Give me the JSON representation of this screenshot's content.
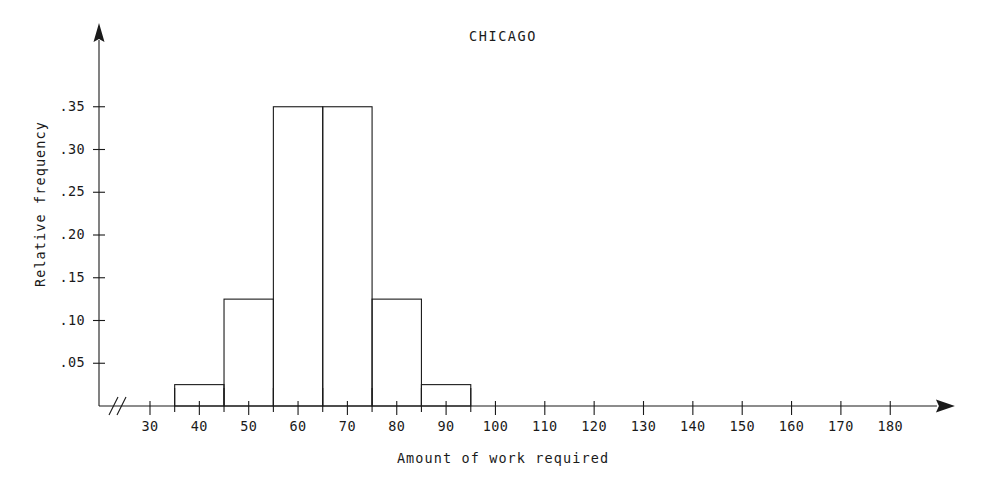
{
  "chart_data": {
    "type": "bar",
    "title": "CHICAGO",
    "xlabel": "Amount of work required",
    "ylabel": "Relative frequency",
    "grid": false,
    "legend": false,
    "legend_position": "none",
    "axis_break": "//",
    "x_axis_arrow": true,
    "y_axis_arrow": true,
    "xlim": [
      30,
      185
    ],
    "ylim": [
      0,
      0.39
    ],
    "bin_width": 10,
    "bin_edges": [
      35,
      45,
      55,
      65,
      75,
      85,
      95
    ],
    "categories": [
      "35-45",
      "45-55",
      "55-65",
      "65-75",
      "75-85",
      "85-95"
    ],
    "values": [
      0.025,
      0.125,
      0.35,
      0.35,
      0.125,
      0.025
    ],
    "xticks_major": [
      30,
      40,
      50,
      60,
      70,
      80,
      90,
      100,
      110,
      120,
      130,
      140,
      150,
      160,
      170,
      180
    ],
    "xtick_labels": [
      "30",
      "40",
      "50",
      "60",
      "70",
      "80",
      "90",
      "100",
      "110",
      "120",
      "130",
      "140",
      "150",
      "160",
      "170",
      "180"
    ],
    "xticks_minor": [
      35,
      45,
      55,
      65,
      75,
      85,
      95
    ],
    "yticks": [
      0.05,
      0.1,
      0.15,
      0.2,
      0.25,
      0.3,
      0.35
    ],
    "ytick_labels": [
      ".05",
      ".10",
      ".15",
      ".20",
      ".25",
      ".30",
      ".35"
    ]
  },
  "colors": {
    "axis": "#1a1a1a",
    "bar_outline": "#1a1a1a",
    "bar_fill": "none",
    "background": "#ffffff",
    "text": "#1a1a1a"
  }
}
